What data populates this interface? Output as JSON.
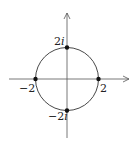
{
  "diagram": {
    "type": "complex-plane-circle",
    "center": [
      0,
      0
    ],
    "radius": 2,
    "points": [
      {
        "name": "top",
        "label_num": "2",
        "label_imag": "i"
      },
      {
        "name": "right",
        "label": "2"
      },
      {
        "name": "left",
        "label": "−2"
      },
      {
        "name": "bottom",
        "label_num": "−2",
        "label_imag": "i"
      }
    ],
    "colors": {
      "stroke": "#333333",
      "axis": "#555555",
      "point": "#111111"
    }
  }
}
